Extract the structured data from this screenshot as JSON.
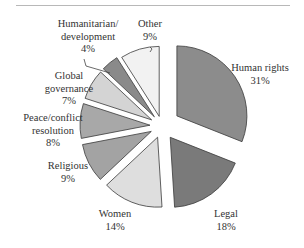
{
  "chart_data": {
    "type": "pie",
    "title": "",
    "exploded": true,
    "start_angle_deg": 0,
    "direction": "clockwise",
    "slices": [
      {
        "label": "Human rights",
        "value": 31,
        "display": "31%",
        "color": "#8c8c8c"
      },
      {
        "label": "Legal",
        "value": 18,
        "display": "18%",
        "color": "#7a7a7a"
      },
      {
        "label": "Women",
        "value": 14,
        "display": "14%",
        "color": "#dedede"
      },
      {
        "label": "Religious",
        "value": 9,
        "display": "9%",
        "color": "#a3a3a3"
      },
      {
        "label": "Peace/conflict resolution",
        "value": 8,
        "display": "8%",
        "color": "#a8a8a8"
      },
      {
        "label": "Global governance",
        "value": 7,
        "display": "7%",
        "color": "#d4d4d4"
      },
      {
        "label": "Humanitarian/ development",
        "value": 4,
        "display": "4%",
        "color": "#8a8a8a"
      },
      {
        "label": "Other",
        "value": 9,
        "display": "9%",
        "color": "#f2f2f2"
      }
    ]
  },
  "labels": {
    "human_rights": {
      "name": "Human rights",
      "pct": "31%"
    },
    "legal": {
      "name": "Legal",
      "pct": "18%"
    },
    "women": {
      "name": "Women",
      "pct": "14%"
    },
    "religious": {
      "name": "Religious",
      "pct": "9%"
    },
    "peace": {
      "line1": "Peace/conflict",
      "line2": "resolution",
      "pct": "8%"
    },
    "global": {
      "line1": "Global",
      "line2": "governance",
      "pct": "7%"
    },
    "humanitarian": {
      "line1": "Humanitarian/",
      "line2": "development",
      "pct": "4%"
    },
    "other": {
      "name": "Other",
      "pct": "9%"
    }
  }
}
